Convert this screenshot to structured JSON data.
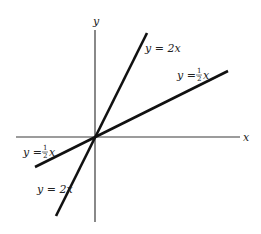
{
  "diagram": {
    "title": "",
    "axes": {
      "x_label": "x",
      "y_label": "y"
    },
    "lines": [
      {
        "name": "steep",
        "equation": "y = 2x",
        "slope": 2,
        "color": "#111111"
      },
      {
        "name": "shallow",
        "equation": "y = 1/2 x",
        "slope": 0.5,
        "color": "#111111"
      }
    ],
    "labels": {
      "upper_steep": {
        "prefix": "y = 2x"
      },
      "upper_shallow": {
        "prefix": "y = ",
        "num": "1",
        "den": "2",
        "var": "x"
      },
      "lower_shallow": {
        "prefix": "y = ",
        "num": "1",
        "den": "2",
        "var": "x"
      },
      "lower_steep": {
        "prefix": "y = 2x"
      }
    }
  }
}
